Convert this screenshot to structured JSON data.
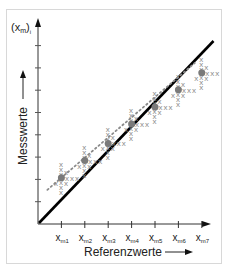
{
  "chart_data": {
    "type": "scatter",
    "title": "",
    "xlabel": "Referenzwerte",
    "ylabel": "Messwerte",
    "y_axis_top_label": "(x_m)_i",
    "categories": [
      "x_m1",
      "x_m2",
      "x_m3",
      "x_m4",
      "x_m5",
      "x_m6",
      "x_m7"
    ],
    "x_tick_labels": [
      {
        "base": "x",
        "sub": "m1"
      },
      {
        "base": "x",
        "sub": "m2"
      },
      {
        "base": "x",
        "sub": "m3"
      },
      {
        "base": "x",
        "sub": "m4"
      },
      {
        "base": "x",
        "sub": "m5"
      },
      {
        "base": "x",
        "sub": "m6"
      },
      {
        "base": "x",
        "sub": "m7"
      }
    ],
    "series": [
      {
        "name": "Messwerte (x markers)",
        "marker": "x",
        "color": "#8a8a8a",
        "cluster_means": [
          1.9,
          2.6,
          3.3,
          4.1,
          4.8,
          5.5,
          6.2
        ]
      },
      {
        "name": "Ausgleichsgerade (dotted)",
        "style": "dotted",
        "color": "#8a8a8a",
        "from": [
          0.4,
          1.4
        ],
        "to": [
          6.7,
          6.6
        ]
      },
      {
        "name": "Ideallinie (y = x)",
        "style": "solid",
        "color": "#000000",
        "from": [
          0,
          0
        ],
        "to": [
          7.5,
          7.5
        ]
      }
    ],
    "y_ticks": 8,
    "grid": false,
    "legend": "none",
    "axis_arrows": true
  },
  "labels": {
    "y_top": "(x",
    "y_top_sub": "m",
    "y_top_end": ")",
    "y_top_i": "i",
    "xlabel": "Referenzwerte",
    "ylabel": "Messwerte"
  }
}
